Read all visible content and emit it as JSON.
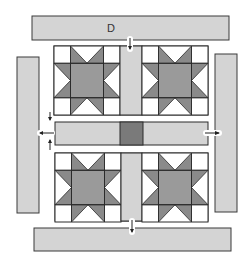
{
  "diagram": {
    "title_label": "D",
    "colors": {
      "background": "#ffffff",
      "border_fill": "#d4d4d4",
      "sashing_fill": "#d4d4d4",
      "cornerstone_fill": "#7a7a7a",
      "star_point_fill": "#8a8a8a",
      "star_center_fill": "#9a9a9a",
      "block_background": "#ffffff",
      "outline": "#2a2a2a",
      "arrow": "#222222"
    },
    "borders": [
      {
        "id": "top",
        "label": "D"
      },
      {
        "id": "left",
        "label": ""
      },
      {
        "id": "right",
        "label": ""
      },
      {
        "id": "bottom",
        "label": ""
      }
    ],
    "blocks": [
      {
        "id": "top-left",
        "type": "sawtooth-star"
      },
      {
        "id": "top-right",
        "type": "sawtooth-star"
      },
      {
        "id": "bottom-left",
        "type": "sawtooth-star"
      },
      {
        "id": "bottom-right",
        "type": "sawtooth-star"
      }
    ],
    "sashing": [
      {
        "id": "vertical-top"
      },
      {
        "id": "horizontal-center",
        "cornerstone": true
      },
      {
        "id": "vertical-bottom"
      }
    ],
    "arrows": [
      {
        "id": "top-down",
        "direction": "down"
      },
      {
        "id": "left-down",
        "direction": "down"
      },
      {
        "id": "left-left",
        "direction": "left"
      },
      {
        "id": "left-up",
        "direction": "up"
      },
      {
        "id": "right-right",
        "direction": "right"
      },
      {
        "id": "bottom-down",
        "direction": "down"
      }
    ]
  }
}
